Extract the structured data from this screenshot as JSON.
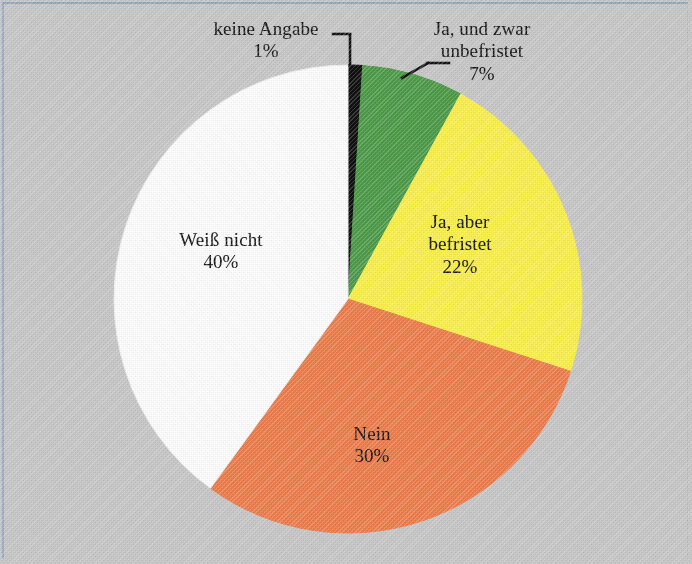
{
  "figure": {
    "background_color": "#c9c9c9",
    "border_color": "#93a9c4"
  },
  "chart_data": {
    "type": "pie",
    "title": "",
    "subtitle": "",
    "xlabel": "",
    "ylabel": "",
    "legend_position": "none",
    "labels_inside": true,
    "start_angle_deg": 0,
    "direction": "clockwise",
    "categories": [
      "keine Angabe",
      "Ja, und zwar unbefristet",
      "Ja, aber befristet",
      "Nein",
      "Weiß nicht"
    ],
    "values": [
      1,
      7,
      22,
      30,
      40
    ],
    "value_labels": [
      "1%",
      "7%",
      "22%",
      "30%",
      "40%"
    ],
    "colors": [
      "#111111",
      "#4f9c4b",
      "#fbf24b",
      "#ef7f4f",
      "#ffffff"
    ],
    "slices": [
      {
        "name": "keine Angabe",
        "value": 1,
        "value_label": "1%",
        "color": "#111111",
        "label_line_1": "keine Angabe",
        "label_line_2": "1%",
        "leader_line": true,
        "label_placement": "outside-top-left"
      },
      {
        "name": "Ja, und zwar unbefristet",
        "value": 7,
        "value_label": "7%",
        "color": "#4f9c4b",
        "label_line_1": "Ja, und zwar",
        "label_line_2": "unbefristet",
        "label_line_3": "7%",
        "leader_line": true,
        "label_placement": "outside-top-right"
      },
      {
        "name": "Ja, aber befristet",
        "value": 22,
        "value_label": "22%",
        "color": "#fbf24b",
        "label_line_1": "Ja, aber",
        "label_line_2": "befristet",
        "label_line_3": "22%",
        "leader_line": false,
        "label_placement": "inside"
      },
      {
        "name": "Nein",
        "value": 30,
        "value_label": "30%",
        "color": "#ef7f4f",
        "label_line_1": "Nein",
        "label_line_2": "30%",
        "leader_line": false,
        "label_placement": "inside"
      },
      {
        "name": "Weiß nicht",
        "value": 40,
        "value_label": "40%",
        "color": "#ffffff",
        "label_line_1": "Weiß nicht",
        "label_line_2": "40%",
        "leader_line": false,
        "label_placement": "inside"
      }
    ]
  },
  "labels": {
    "keine_angabe": {
      "line1": "keine Angabe",
      "line2": "1%"
    },
    "unbefristet": {
      "line1": "Ja, und zwar",
      "line2": "unbefristet",
      "line3": "7%"
    },
    "befristet": {
      "line1": "Ja, aber",
      "line2": "befristet",
      "line3": "22%"
    },
    "nein": {
      "line1": "Nein",
      "line2": "30%"
    },
    "weiss_nicht": {
      "line1": "Weiß nicht",
      "line2": "40%"
    }
  }
}
